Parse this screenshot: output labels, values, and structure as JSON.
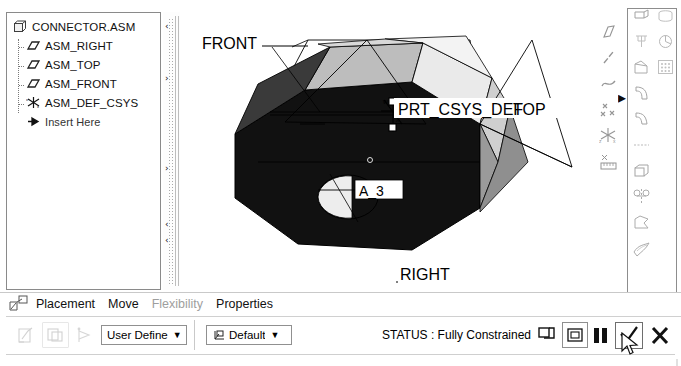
{
  "window": {
    "title": "CONNECTOR.ASM"
  },
  "model_tree": {
    "panel_name": "model-tree",
    "root": {
      "label": "CONNECTOR.ASM",
      "icon": "assembly-icon"
    },
    "items": [
      {
        "label": "ASM_RIGHT",
        "icon": "datum-plane-icon"
      },
      {
        "label": "ASM_TOP",
        "icon": "datum-plane-icon"
      },
      {
        "label": "ASM_FRONT",
        "icon": "datum-plane-icon"
      },
      {
        "label": "ASM_DEF_CSYS",
        "icon": "coordinate-system-icon"
      },
      {
        "label": "Insert Here",
        "icon": "insert-arrow-icon"
      }
    ],
    "scroll_up_arrow": "‹",
    "scroll_down_arrow": "›"
  },
  "graphics": {
    "name": "3d-model-viewport",
    "annotations": [
      {
        "name": "datum-label-front",
        "text": "FRONT"
      },
      {
        "name": "datum-label-top",
        "text": "TOP"
      },
      {
        "name": "csys-label-prt-csys-def",
        "text": "PRT_CSYS_DEF"
      },
      {
        "name": "axis-label-a3",
        "text": "A_3"
      },
      {
        "name": "datum-label-right",
        "text": "RIGHT"
      }
    ],
    "colors": {
      "face_dark": "#111111",
      "face_mid": "#bdbdbd",
      "face_light": "#e8e8e8",
      "face_shadow": "#8f8f8f",
      "outline": "#000000",
      "background": "#ffffff"
    }
  },
  "right_toolbar": {
    "name": "feature-toolbar",
    "loose_icons": [
      {
        "name": "datum-plane-icon"
      },
      {
        "name": "datum-axis-icon"
      },
      {
        "name": "datum-curve-icon"
      },
      {
        "name": "datum-point-icon"
      },
      {
        "name": "coordinate-system-icon"
      },
      {
        "name": "analysis-feature-icon"
      }
    ],
    "flyout_arrow": "▸",
    "panel_column_1": [
      {
        "name": "extrude-icon"
      },
      {
        "name": "revolve-icon"
      },
      {
        "name": "sweep-icon"
      },
      {
        "name": "round-icon"
      },
      {
        "name": "chamfer-icon"
      },
      {
        "name": "rib-icon"
      },
      {
        "name": "draft-icon"
      },
      {
        "name": "shell-icon"
      }
    ],
    "panel_column_2": [
      {
        "name": "hole-icon"
      },
      {
        "name": "pattern-icon"
      },
      {
        "name": "mirror-icon"
      },
      {
        "name": "trim-icon"
      },
      {
        "name": "thicken-icon"
      },
      {
        "name": "merge-icon"
      },
      {
        "name": "offset-icon"
      }
    ]
  },
  "dashboard": {
    "name": "component-placement-dashboard",
    "lead_icon": "placement-dashboard-icon",
    "tabs": [
      {
        "label": "Placement",
        "disabled": false
      },
      {
        "label": "Move",
        "disabled": false
      },
      {
        "label": "Flexibility",
        "disabled": true
      },
      {
        "label": "Properties",
        "disabled": false
      }
    ],
    "tool_buttons": [
      {
        "name": "user-defined-set-button"
      },
      {
        "name": "copy-placement-button"
      },
      {
        "name": "connection-preview-button"
      }
    ],
    "constraint_combo": {
      "name": "constraint-type-select",
      "value": "User Define",
      "arrow": "▼"
    },
    "datum_combo": {
      "name": "placement-reference-select",
      "value": "Default",
      "icon": "csys-small-icon",
      "arrow": "▼"
    },
    "status": {
      "label": "STATUS : Fully Constrained",
      "display_toggle_icon": "window-display-icon",
      "separate_window_icon": "separate-window-icon",
      "pause_button": "pause-button",
      "accept_button": "accept-check-button",
      "cancel_button": "cancel-x-button",
      "accept_glyph": "✓",
      "cancel_glyph": "✕"
    }
  },
  "cursor": {
    "name": "mouse-pointer",
    "x": 620,
    "y": 332
  }
}
